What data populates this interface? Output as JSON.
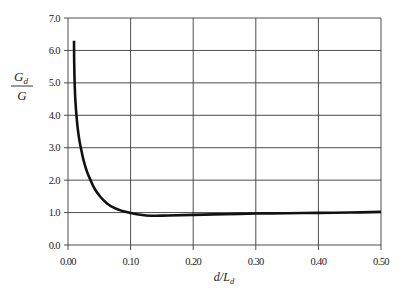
{
  "chart_data": {
    "type": "line",
    "title": "",
    "xlabel": "d/L_d",
    "xlabel_main": "d/L",
    "xlabel_sub": "d",
    "ylabel": "G_d / G",
    "ylabel_num_main": "G",
    "ylabel_num_sub": "d",
    "ylabel_den": "G",
    "xlim": [
      0.0,
      0.5
    ],
    "ylim": [
      0.0,
      7.0
    ],
    "grid": true,
    "legend": null,
    "x_ticks": [
      0.0,
      0.1,
      0.2,
      0.3,
      0.4,
      0.5
    ],
    "x_tick_labels": [
      "0.00",
      "0.10",
      "0.20",
      "0.30",
      "0.40",
      "0.50"
    ],
    "y_ticks": [
      0.0,
      1.0,
      2.0,
      3.0,
      4.0,
      5.0,
      6.0,
      7.0
    ],
    "y_tick_labels": [
      "0.0",
      "1.0",
      "2.0",
      "3.0",
      "4.0",
      "5.0",
      "6.0",
      "7.0"
    ],
    "series": [
      {
        "name": "G_d/G",
        "color": "#111111",
        "x": [
          0.0096,
          0.0098,
          0.0102,
          0.0108,
          0.0118,
          0.0135,
          0.0155,
          0.018,
          0.021,
          0.025,
          0.03,
          0.036,
          0.043,
          0.052,
          0.062,
          0.073,
          0.085,
          0.097,
          0.11,
          0.125,
          0.14,
          0.16,
          0.2,
          0.25,
          0.3,
          0.35,
          0.4,
          0.45,
          0.5
        ],
        "y": [
          6.3,
          5.8,
          5.3,
          4.9,
          4.45,
          4.0,
          3.6,
          3.25,
          2.95,
          2.6,
          2.28,
          2.0,
          1.72,
          1.48,
          1.29,
          1.15,
          1.06,
          1.0,
          0.95,
          0.91,
          0.9,
          0.91,
          0.93,
          0.95,
          0.97,
          0.98,
          0.99,
          1.0,
          1.02
        ]
      }
    ]
  }
}
